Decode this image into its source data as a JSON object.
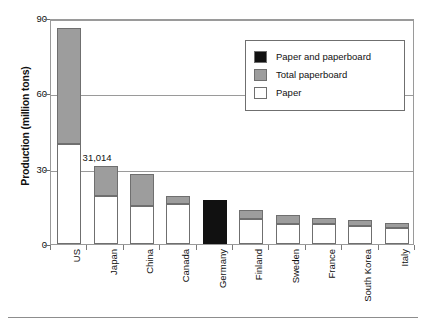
{
  "chart_data": {
    "type": "bar",
    "title": "",
    "subtitle": "",
    "xlabel": "",
    "ylabel": "Production (million tons)",
    "ylim": [
      0,
      90
    ],
    "yticks": [
      0,
      30,
      60,
      90
    ],
    "grid": true,
    "stacked": true,
    "legend_position": "top-right",
    "categories": [
      "US",
      "Japan",
      "China",
      "Canada",
      "Germany",
      "Finland",
      "Sweden",
      "France",
      "South Korea",
      "Italy"
    ],
    "series": [
      {
        "name": "Paper",
        "color": "#ffffff",
        "values": [
          40.0,
          19.0,
          15.0,
          16.0,
          0,
          10.0,
          8.0,
          8.0,
          7.0,
          6.5
        ]
      },
      {
        "name": "Total paperboard",
        "color": "#9d9d9d",
        "values": [
          46.0,
          12.0,
          13.0,
          3.0,
          0,
          3.5,
          3.5,
          2.5,
          2.5,
          2.0
        ]
      },
      {
        "name": "Paper and paperboard",
        "color": "#111111",
        "values": [
          0,
          0,
          0,
          0,
          17.5,
          0,
          0,
          0,
          0,
          0
        ]
      }
    ],
    "totals": [
      86.0,
      31.0,
      28.0,
      19.0,
      17.5,
      13.5,
      11.5,
      10.5,
      9.5,
      8.5
    ],
    "annotations": [
      {
        "text": "31,014",
        "category": "Japan",
        "value": 31.0
      }
    ],
    "legend_entries": [
      {
        "label": "Paper and paperboard",
        "color": "#111111"
      },
      {
        "label": "Total paperboard",
        "color": "#9d9d9d"
      },
      {
        "label": "Paper",
        "color": "#ffffff"
      }
    ]
  },
  "axis": {
    "y_title": "Production (million tons)",
    "y_ticks": [
      "0",
      "30",
      "60",
      "90"
    ]
  },
  "legend": {
    "items": [
      {
        "label": "Paper and paperboard"
      },
      {
        "label": "Total paperboard"
      },
      {
        "label": "Paper"
      }
    ]
  },
  "annotation": {
    "japan_value_label": "31,014"
  },
  "categories": {
    "list": [
      "US",
      "Japan",
      "China",
      "Canada",
      "Germany",
      "Finland",
      "Sweden",
      "France",
      "South Korea",
      "Italy"
    ]
  }
}
